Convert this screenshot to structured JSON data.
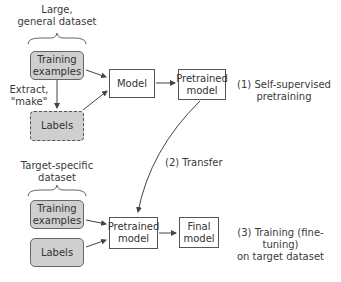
{
  "diagram": {
    "top_dataset_label": "Large,\ngeneral dataset",
    "top_training": "Training\nexamples",
    "extract_label": "Extract,\n\"make\"",
    "top_labels": "Labels",
    "model": "Model",
    "pretrained_top": "Pretrained\nmodel",
    "step1": "(1) Self-supervised\npretraining",
    "step2": "(2) Transfer",
    "bottom_dataset_label": "Target-specific\ndataset",
    "bottom_training": "Training\nexamples",
    "bottom_labels": "Labels",
    "pretrained_bottom": "Pretrained\nmodel",
    "final_model": "Final\nmodel",
    "step3": "(3) Training (fine-tuning)\non target dataset"
  },
  "colors": {
    "box_fill_gray": "#cfcfcf",
    "border": "#555555",
    "text": "#333333"
  }
}
